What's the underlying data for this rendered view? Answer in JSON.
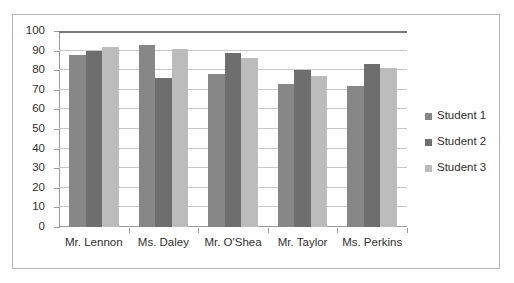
{
  "chart_data": {
    "type": "bar",
    "title": "",
    "xlabel": "",
    "ylabel": "",
    "ylim": [
      0,
      100
    ],
    "ytick_step": 10,
    "yticks": [
      0,
      10,
      20,
      30,
      40,
      50,
      60,
      70,
      80,
      90,
      100
    ],
    "grid": true,
    "legend_position": "right",
    "categories": [
      "Mr. Lennon",
      "Ms. Daley",
      "Mr. O'Shea",
      "Mr. Taylor",
      "Ms. Perkins"
    ],
    "series": [
      {
        "name": "Student 1",
        "color": "#878787",
        "values": [
          88,
          93,
          78,
          73,
          72
        ]
      },
      {
        "name": "Student 2",
        "color": "#6e6e6e",
        "values": [
          90,
          76,
          89,
          80,
          83
        ]
      },
      {
        "name": "Student 3",
        "color": "#bcbcbc",
        "values": [
          92,
          91,
          86,
          77,
          81
        ]
      }
    ]
  }
}
